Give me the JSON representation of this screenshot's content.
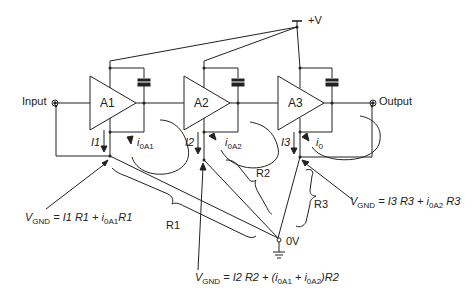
{
  "diagram": {
    "supply_label": "+V",
    "ground_label": "0V",
    "input_label": "Input",
    "output_label": "Output",
    "amplifiers": [
      {
        "name": "A1"
      },
      {
        "name": "A2"
      },
      {
        "name": "A3"
      }
    ],
    "currents": {
      "I1": "I1",
      "I2": "I2",
      "I3": "I3",
      "i_0A1_main": "i",
      "i_0A1_sub": "0A1",
      "i_0A2_main": "i",
      "i_0A2_sub": "0A2",
      "i_0_main": "i",
      "i_0_sub": "0"
    },
    "resistances": {
      "R1": "R1",
      "R2": "R2",
      "R3": "R3"
    },
    "equations": {
      "eq1": {
        "v": "V",
        "v_sub": "GND",
        "part1": " = I1 R1 + ",
        "i": "i",
        "i_sub": "0A1",
        "part2": "R1"
      },
      "eq2": {
        "v": "V",
        "v_sub": "GND",
        "part1": " = I2 R2 + (",
        "i1": "i",
        "i1_sub": "0A1",
        "plus": " + ",
        "i2": "i",
        "i2_sub": "0A2",
        "part2": ")R2"
      },
      "eq3": {
        "v": "V",
        "v_sub": "GND",
        "part1": " = I3 R3 + ",
        "i": "i",
        "i_sub": "0A2",
        "part2": " R3"
      }
    }
  }
}
